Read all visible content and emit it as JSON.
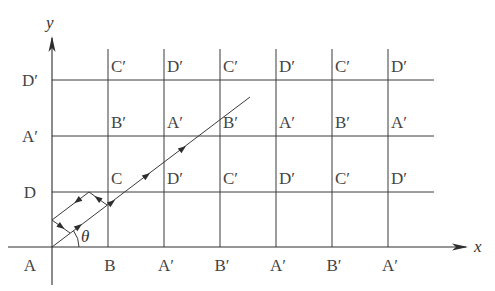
{
  "diagram": {
    "type": "reflection-grid",
    "axes": {
      "x_label": "x",
      "y_label": "y",
      "origin": [
        52,
        247
      ],
      "x_end": 468,
      "y_end": 36,
      "x_start": 8,
      "y_bottom": 285
    },
    "grid": {
      "vertical_x": [
        108,
        164,
        220,
        276,
        332,
        388
      ],
      "vertical_top": 49,
      "horizontal_y": [
        80,
        136,
        192
      ],
      "horizontal_right": 434
    },
    "angle_label": "θ",
    "left_labels": [
      {
        "text": "D′",
        "y": 80
      },
      {
        "text": "A′",
        "y": 136
      },
      {
        "text": "D",
        "y": 192
      },
      {
        "text": "A",
        "y": 247
      }
    ],
    "bottom_labels": [
      "B",
      "A′",
      "B′",
      "A′",
      "B′",
      "A′"
    ],
    "cell_labels": {
      "row_top": [
        "C′",
        "D′",
        "C′",
        "D′",
        "C′",
        "D′"
      ],
      "row_middle": [
        "B′",
        "A′",
        "B′",
        "A′",
        "B′",
        "A′"
      ],
      "row_bottom": [
        "C",
        "D′",
        "C′",
        "D′",
        "C′",
        "D′"
      ]
    },
    "ray": {
      "start": [
        52,
        247
      ],
      "end": [
        250,
        97
      ],
      "arrows_at": [
        [
          82,
          224
        ],
        [
          115,
          200
        ],
        [
          150,
          173
        ],
        [
          186,
          146
        ]
      ]
    },
    "reflection_path": {
      "points": [
        [
          107,
          205
        ],
        [
          89,
          192
        ],
        [
          52,
          220
        ],
        [
          70,
          233
        ]
      ]
    },
    "colors": {
      "line": "#3a3a3a",
      "text": "#444444",
      "background": "#ffffff"
    }
  }
}
